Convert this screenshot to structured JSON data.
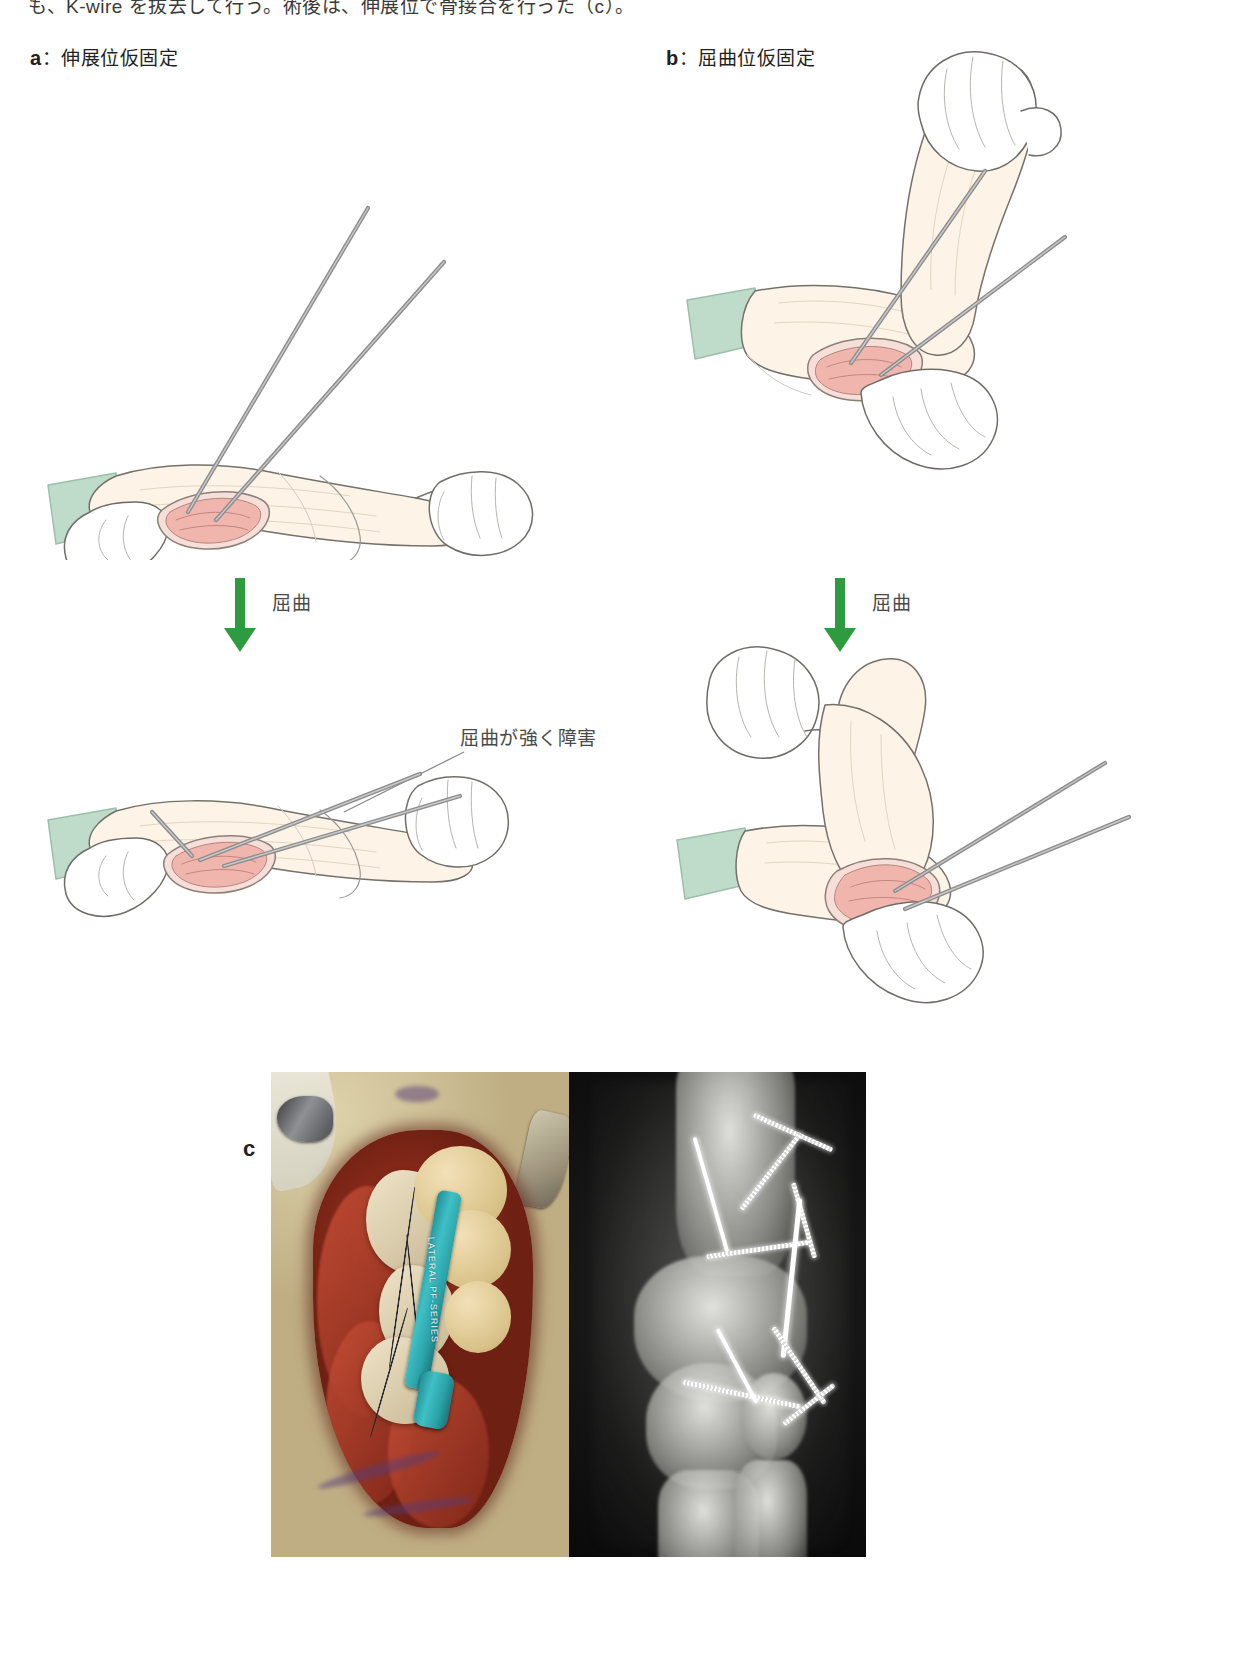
{
  "figure": {
    "cut_caption_top": "も、K-wire を抜去して行う。術後は、伸展位で骨接合を行った（c）。",
    "panels": [
      {
        "id": "a",
        "letter": "a",
        "separator": "：",
        "title": "伸展位仮固定",
        "label_full": "a：伸展位仮固定"
      },
      {
        "id": "b",
        "letter": "b",
        "separator": "：",
        "title": "屈曲位仮固定",
        "label_full": "b：屈曲位仮固定"
      }
    ],
    "arrows": [
      {
        "id": "arrow-left",
        "label": "屈曲",
        "direction": "down",
        "color": "#2e9b3f"
      },
      {
        "id": "arrow-right",
        "label": "屈曲",
        "direction": "down",
        "color": "#2e9b3f"
      }
    ],
    "annotations": [
      {
        "id": "flexion-impaired",
        "text": "屈曲が強く障害"
      }
    ],
    "photo_panel": {
      "letter": "c",
      "images": [
        {
          "id": "clinical-photo",
          "kind": "intraoperative-photograph",
          "instrument_text": "LATERAL PF-SERIES"
        },
        {
          "id": "xray-photo",
          "kind": "radiograph"
        }
      ]
    },
    "colors": {
      "arrow_green": "#2e9b3f",
      "text_gray": "#4a4a4a",
      "text_black": "#231f20",
      "glove_outline": "#6d6a66",
      "drape_green": "#b9d8c8",
      "wound_pink": "#e8a9a2",
      "kwire_gray": "#8b8b8b"
    }
  }
}
